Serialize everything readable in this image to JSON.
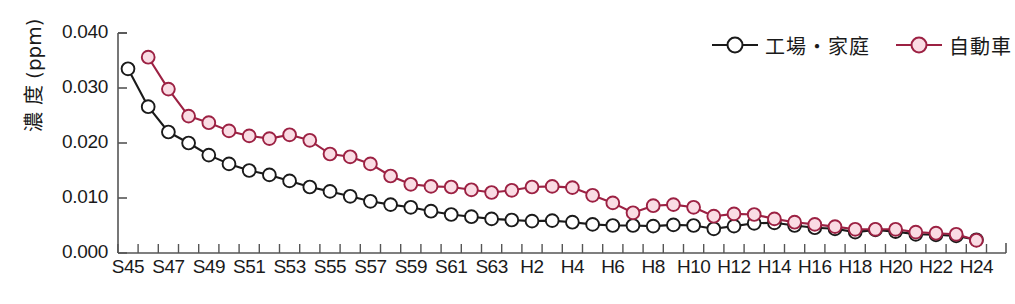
{
  "chart_data": {
    "type": "line",
    "title": "",
    "subtitle": "",
    "xlabel": "",
    "ylabel": "濃 度 (ppm)",
    "ylim": [
      0.0,
      0.04
    ],
    "ytick_labels": [
      "0.000",
      "0.010",
      "0.020",
      "0.030",
      "0.040"
    ],
    "ytick_values": [
      0.0,
      0.01,
      0.02,
      0.03,
      0.04
    ],
    "grid": false,
    "legend_position": "top-right",
    "x": [
      "S45",
      "S46",
      "S47",
      "S48",
      "S49",
      "S50",
      "S51",
      "S52",
      "S53",
      "S54",
      "S55",
      "S56",
      "S57",
      "S58",
      "S59",
      "S60",
      "S61",
      "S62",
      "S63",
      "H1",
      "H2",
      "H3",
      "H4",
      "H5",
      "H6",
      "H7",
      "H8",
      "H9",
      "H10",
      "H11",
      "H12",
      "H13",
      "H14",
      "H15",
      "H16",
      "H17",
      "H18",
      "H19",
      "H20",
      "H21",
      "H22",
      "H23",
      "H24"
    ],
    "xtick_labels": [
      "S45",
      "S47",
      "S49",
      "S51",
      "S53",
      "S55",
      "S57",
      "S59",
      "S61",
      "S63",
      "H2",
      "H4",
      "H6",
      "H8",
      "H10",
      "H12",
      "H14",
      "H16",
      "H18",
      "H20",
      "H22",
      "H24"
    ],
    "series": [
      {
        "name": "工場・家庭",
        "color": "#1a1a1a",
        "marker_fill": "#ffffff",
        "values": [
          0.0335,
          0.0266,
          0.022,
          0.02,
          0.0178,
          0.0162,
          0.015,
          0.0142,
          0.0131,
          0.012,
          0.0112,
          0.0103,
          0.0094,
          0.0088,
          0.0083,
          0.0076,
          0.007,
          0.0066,
          0.0062,
          0.006,
          0.0058,
          0.0059,
          0.0056,
          0.0052,
          0.005,
          0.005,
          0.0049,
          0.0051,
          0.005,
          0.0044,
          0.0049,
          0.0054,
          0.0055,
          0.005,
          0.0046,
          0.0044,
          0.0038,
          0.0042,
          0.0039,
          0.0034,
          0.0033,
          0.0031,
          0.0024
        ]
      },
      {
        "name": "自動車",
        "color": "#9c2143",
        "marker_fill": "#fadce4",
        "values": [
          null,
          0.0356,
          0.0298,
          0.0249,
          0.0237,
          0.0222,
          0.0213,
          0.0208,
          0.0215,
          0.0205,
          0.018,
          0.0175,
          0.0162,
          0.014,
          0.0125,
          0.0121,
          0.012,
          0.0115,
          0.011,
          0.0114,
          0.012,
          0.0121,
          0.0119,
          0.0105,
          0.0091,
          0.0073,
          0.0086,
          0.0088,
          0.0083,
          0.0067,
          0.0071,
          0.007,
          0.0062,
          0.0056,
          0.0052,
          0.0048,
          0.0043,
          0.0043,
          0.0043,
          0.0038,
          0.0036,
          0.0034,
          0.0023
        ]
      }
    ]
  },
  "legend": {
    "items": [
      {
        "label": "工場・家庭",
        "color": "#1a1a1a",
        "fill": "#ffffff"
      },
      {
        "label": "自動車",
        "color": "#9c2143",
        "fill": "#fadce4"
      }
    ]
  },
  "axes": {
    "colors": {
      "axis_line": "#555555",
      "text": "#1a1a1a",
      "background": "#ffffff"
    }
  }
}
